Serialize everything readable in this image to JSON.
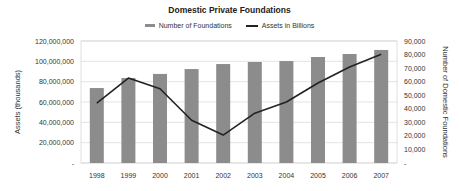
{
  "chart_data": {
    "type": "bar+line",
    "title": "Domestic Private Foundations",
    "categories": [
      "1998",
      "1999",
      "2000",
      "2001",
      "2002",
      "2003",
      "2004",
      "2005",
      "2006",
      "2007"
    ],
    "series": [
      {
        "name": "Number of Foundations",
        "type": "bar",
        "axis": "right",
        "color": "#8c8c8c",
        "values": [
          55300,
          62700,
          65700,
          69300,
          73000,
          74500,
          75200,
          78200,
          80400,
          83400
        ]
      },
      {
        "name": "Assets in Billions",
        "type": "line",
        "axis": "left",
        "color": "#222222",
        "values": [
          59000000,
          83600000,
          73000000,
          42000000,
          27500000,
          49000000,
          60000000,
          78700000,
          94400000,
          107000000
        ]
      }
    ],
    "ylabel": "Assets (thousands)",
    "y2label": "Number of Domestic Foundations",
    "ylim": [
      0,
      120000000
    ],
    "y2lim": [
      0,
      90000
    ],
    "yticks": [
      "-",
      "20,000,000",
      "40,000,000",
      "60,000,000",
      "80,000,000",
      "100,000,000",
      "120,000,000"
    ],
    "y2ticks": [
      "-",
      "10,000",
      "20,000",
      "30,000",
      "40,000",
      "50,000",
      "60,000",
      "70,000",
      "80,000",
      "90,000"
    ],
    "grid": true,
    "legend_position": "top"
  },
  "legend": {
    "bar_label": "Number of Foundations",
    "line_label": "Assets in Billions"
  }
}
